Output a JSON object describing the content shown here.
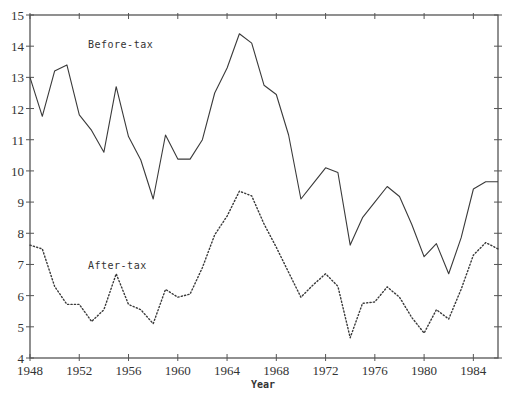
{
  "chart_data": {
    "type": "line",
    "title": "",
    "xlabel": "Year",
    "ylabel": "",
    "xlim": [
      1948,
      1986
    ],
    "ylim": [
      4,
      15
    ],
    "grid": false,
    "legend": "inline labels",
    "x_ticks": [
      1948,
      1952,
      1956,
      1960,
      1964,
      1968,
      1972,
      1976,
      1980,
      1984
    ],
    "y_ticks": [
      4,
      5,
      6,
      7,
      8,
      9,
      10,
      11,
      12,
      13,
      14,
      15
    ],
    "x": [
      1948,
      1949,
      1950,
      1951,
      1952,
      1953,
      1954,
      1955,
      1956,
      1957,
      1958,
      1959,
      1960,
      1961,
      1962,
      1963,
      1964,
      1965,
      1966,
      1967,
      1968,
      1969,
      1970,
      1971,
      1972,
      1973,
      1974,
      1975,
      1976,
      1977,
      1978,
      1979,
      1980,
      1981,
      1982,
      1983,
      1984,
      1985,
      1986
    ],
    "series": [
      {
        "name": "Before-tax",
        "style": "solid",
        "values": [
          13.0,
          11.75,
          13.2,
          13.4,
          11.8,
          11.3,
          10.6,
          12.7,
          11.1,
          10.35,
          9.1,
          11.15,
          10.38,
          10.38,
          11.0,
          12.5,
          13.3,
          14.4,
          14.1,
          12.75,
          12.45,
          11.15,
          9.1,
          9.6,
          10.1,
          9.95,
          7.62,
          8.5,
          9.0,
          9.5,
          9.18,
          8.28,
          7.25,
          7.67,
          6.7,
          7.85,
          9.42,
          9.65,
          9.65
        ]
      },
      {
        "name": "After-tax",
        "style": "dotted",
        "values": [
          7.62,
          7.5,
          6.3,
          5.72,
          5.72,
          5.17,
          5.55,
          6.7,
          5.72,
          5.55,
          5.1,
          6.2,
          5.95,
          6.05,
          6.9,
          7.95,
          8.55,
          9.35,
          9.2,
          8.3,
          7.55,
          6.75,
          5.95,
          6.35,
          6.7,
          6.3,
          4.65,
          5.75,
          5.8,
          6.28,
          5.95,
          5.3,
          4.8,
          5.55,
          5.25,
          6.2,
          7.3,
          7.7,
          7.5
        ]
      }
    ],
    "annotations": [
      {
        "text": "Before-tax",
        "x": 1952.8,
        "y": 14.0
      },
      {
        "text": "After-tax",
        "x": 1952.8,
        "y": 7.0
      }
    ]
  },
  "labels": {
    "before_tax": "Before-tax",
    "after_tax": "After-tax",
    "x_axis_title": "Year"
  },
  "colors": {
    "line": "#3a3a3a",
    "axis": "#555555"
  }
}
